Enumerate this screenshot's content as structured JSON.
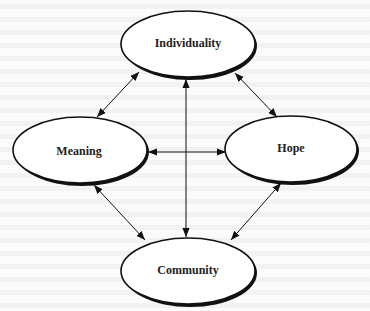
{
  "diagram": {
    "nodes": [
      {
        "id": "individuality",
        "label": "Individuality",
        "cx": 188,
        "cy": 44,
        "rx": 67,
        "ry": 34
      },
      {
        "id": "meaning",
        "label": "Meaning",
        "cx": 80,
        "cy": 150,
        "rx": 67,
        "ry": 34
      },
      {
        "id": "hope",
        "label": "Hope",
        "cx": 291,
        "cy": 149,
        "rx": 66,
        "ry": 34
      },
      {
        "id": "community",
        "label": "Community",
        "cx": 188,
        "cy": 271,
        "rx": 67,
        "ry": 34
      }
    ],
    "edges": [
      {
        "from": "meaning",
        "to": "individuality",
        "bidirectional": true
      },
      {
        "from": "individuality",
        "to": "hope",
        "bidirectional": true
      },
      {
        "from": "meaning",
        "to": "hope",
        "bidirectional": true
      },
      {
        "from": "individuality",
        "to": "community",
        "bidirectional": true
      },
      {
        "from": "meaning",
        "to": "community",
        "bidirectional": true
      },
      {
        "from": "hope",
        "to": "community",
        "bidirectional": true
      }
    ],
    "colors": {
      "stroke": "#111111",
      "fill": "#ffffff",
      "background": "#fbfbfb"
    }
  }
}
